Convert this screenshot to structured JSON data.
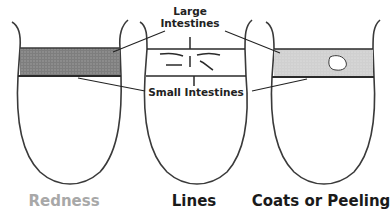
{
  "diagram": {
    "callouts": {
      "large_intestines_line1": "Large",
      "large_intestines_line2": "Intestines",
      "small_intestines": "Small Intestines"
    },
    "tongues": [
      {
        "caption": "Redness",
        "caption_color": "#a8a8a8",
        "band_fill": "#8c8c8c",
        "feature": "shaded-band"
      },
      {
        "caption": "Lines",
        "caption_color": "#1a1a1a",
        "band_fill": "#ffffff",
        "feature": "line-marks"
      },
      {
        "caption": "Coats or Peeling",
        "caption_color": "#1a1a1a",
        "band_fill": "#d6d6d6",
        "feature": "peeled-spot"
      }
    ],
    "colors": {
      "outline": "#3a3a3a",
      "leader": "#222222"
    }
  }
}
